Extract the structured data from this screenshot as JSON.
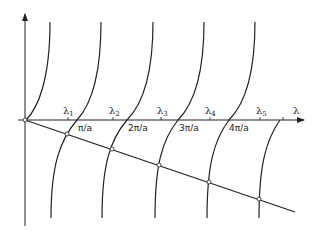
{
  "diagram": {
    "type": "graphical-solution",
    "axes": {
      "x_label": "λ",
      "x_ticks": [
        "π/a",
        "2π/a",
        "3π/a",
        "4π/a"
      ],
      "roots": [
        {
          "base": "λ",
          "sub": "1"
        },
        {
          "base": "λ",
          "sub": "2"
        },
        {
          "base": "λ",
          "sub": "3"
        },
        {
          "base": "λ",
          "sub": "4"
        },
        {
          "base": "λ",
          "sub": "5"
        }
      ]
    },
    "branches": 5,
    "line": {
      "from": "origin",
      "slope": "negative"
    },
    "colors": {
      "ink": "#222222",
      "background": "#ffffff"
    }
  }
}
